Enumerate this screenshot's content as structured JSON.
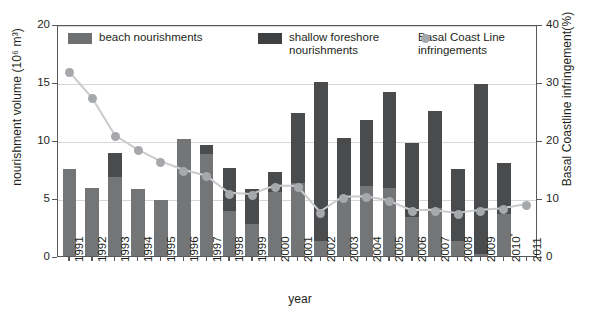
{
  "chart_data": {
    "type": "bar",
    "title": "",
    "xlabel": "year",
    "ylabel": "nourishment volume (10⁶ m³)",
    "y2label": "Basal Coastline infringement(%)",
    "ylim": [
      0,
      20
    ],
    "y2lim": [
      0,
      40
    ],
    "yticks": [
      0,
      5,
      10,
      15,
      20
    ],
    "y2ticks": [
      0,
      10,
      20,
      30,
      40
    ],
    "grid": true,
    "legend_position": "top-inside",
    "categories": [
      "1991",
      "1992",
      "1993",
      "1994",
      "1995",
      "1996",
      "1997",
      "1998",
      "1999",
      "2000",
      "2001",
      "2002",
      "2003",
      "2004",
      "2005",
      "2006",
      "2007",
      "2008",
      "2009",
      "2010*",
      "2011"
    ],
    "series": [
      {
        "name": "beach nourishments",
        "color": "#747576",
        "values": [
          7.5,
          5.9,
          6.8,
          5.8,
          4.8,
          10.1,
          8.8,
          3.9,
          2.8,
          5.5,
          6.3,
          1.3,
          5.0,
          6.0,
          5.9,
          3.4,
          4.1,
          1.3,
          0.2,
          3.6,
          0
        ]
      },
      {
        "name": "shallow foreshore nourishments",
        "color": "#4a4b4d",
        "values": [
          0.0,
          0.0,
          2.1,
          0.0,
          0.0,
          0.0,
          0.8,
          3.7,
          3.0,
          1.7,
          6.0,
          13.7,
          5.2,
          5.7,
          8.2,
          6.3,
          8.4,
          6.2,
          14.6,
          4.4,
          0
        ]
      },
      {
        "name": "total nourishment volume",
        "color": "#4a4b4d",
        "values": [
          7.5,
          5.9,
          8.9,
          5.8,
          4.8,
          10.1,
          9.6,
          7.6,
          5.8,
          7.2,
          12.3,
          15.0,
          10.2,
          11.7,
          14.1,
          9.7,
          12.5,
          7.5,
          14.8,
          8.0,
          0
        ]
      }
    ],
    "marker_series": {
      "name": "Basal Coast Line infringements",
      "color": "#a6a8ab",
      "axis": "right",
      "unit": "%",
      "values": [
        32.0,
        27.5,
        21.0,
        18.5,
        16.5,
        15.0,
        14.0,
        11.0,
        10.8,
        12.2,
        12.2,
        7.7,
        10.3,
        10.4,
        9.7,
        8.0,
        8.0,
        7.5,
        8.0,
        8.3,
        9.0
      ]
    }
  },
  "legend": {
    "items": [
      {
        "label": "beach nourishments",
        "marker": "square-swatch-light"
      },
      {
        "label": "shallow foreshore\nnourishments",
        "marker": "square-swatch-dark"
      },
      {
        "label": "Basal Coast Line\ninfringements",
        "marker": "circle-dot-gray"
      }
    ]
  },
  "axes": {
    "y_title": "nourishment volume (10⁶ m³)",
    "y2_title": "Basal Coastline infringement(%)",
    "x_title": "year",
    "y_tick_labels": [
      "0",
      "5",
      "10",
      "15",
      "20"
    ],
    "y2_tick_labels": [
      "0",
      "10",
      "20",
      "30",
      "40"
    ],
    "x_tick_labels": [
      "1991",
      "1992",
      "1993",
      "1994",
      "1995",
      "1996",
      "1997",
      "1998",
      "1999",
      "2000",
      "2001",
      "2002",
      "2003",
      "2004",
      "2005",
      "2006",
      "2007",
      "2008",
      "2009",
      "2010",
      "2011"
    ],
    "x_tick_superscripts": [
      "",
      "",
      "",
      "",
      "",
      "",
      "",
      "",
      "",
      "",
      "",
      "",
      "",
      "",
      "",
      "",
      "",
      "",
      "",
      "*",
      ""
    ]
  }
}
